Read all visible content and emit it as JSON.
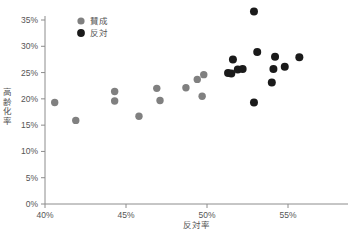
{
  "chart_data": {
    "type": "scatter",
    "title": "",
    "xlabel": "反対率",
    "ylabel": "高齢化率",
    "xlim": [
      40,
      57.5
    ],
    "ylim": [
      0,
      36.5
    ],
    "xticks": [
      "40%",
      "45%",
      "50%",
      "55%"
    ],
    "xtick_values": [
      40,
      45,
      50,
      55
    ],
    "yticks": [
      "0%",
      "5%",
      "10%",
      "15%",
      "20%",
      "25%",
      "30%",
      "35%"
    ],
    "ytick_values": [
      0,
      5,
      10,
      15,
      20,
      25,
      30,
      35
    ],
    "grid": false,
    "legend_position": "top-left",
    "series": [
      {
        "name": "賛成",
        "color": "#808080",
        "marker": "circle",
        "points": [
          {
            "x": 40.6,
            "y": 19.3
          },
          {
            "x": 41.9,
            "y": 15.9
          },
          {
            "x": 44.3,
            "y": 21.4
          },
          {
            "x": 44.3,
            "y": 19.6
          },
          {
            "x": 45.8,
            "y": 16.7
          },
          {
            "x": 46.9,
            "y": 22.0
          },
          {
            "x": 47.1,
            "y": 19.7
          },
          {
            "x": 48.7,
            "y": 22.1
          },
          {
            "x": 49.4,
            "y": 23.7
          },
          {
            "x": 49.8,
            "y": 24.6
          },
          {
            "x": 49.7,
            "y": 20.5
          }
        ]
      },
      {
        "name": "反対",
        "color": "#1a1a1a",
        "marker": "circle",
        "points": [
          {
            "x": 51.3,
            "y": 24.9
          },
          {
            "x": 51.5,
            "y": 24.8
          },
          {
            "x": 51.6,
            "y": 27.5
          },
          {
            "x": 51.9,
            "y": 25.6
          },
          {
            "x": 52.2,
            "y": 25.7
          },
          {
            "x": 52.9,
            "y": 36.6
          },
          {
            "x": 53.1,
            "y": 28.9
          },
          {
            "x": 52.9,
            "y": 19.3
          },
          {
            "x": 54.1,
            "y": 25.7
          },
          {
            "x": 54.2,
            "y": 28.0
          },
          {
            "x": 54.0,
            "y": 23.1
          },
          {
            "x": 54.8,
            "y": 26.1
          },
          {
            "x": 55.7,
            "y": 27.9
          }
        ]
      }
    ]
  },
  "legend": {
    "items": [
      {
        "label": "賛成",
        "color": "#808080"
      },
      {
        "label": "反対",
        "color": "#1a1a1a"
      }
    ]
  },
  "ylabel_chars": [
    "高",
    "齢",
    "化",
    "率"
  ]
}
